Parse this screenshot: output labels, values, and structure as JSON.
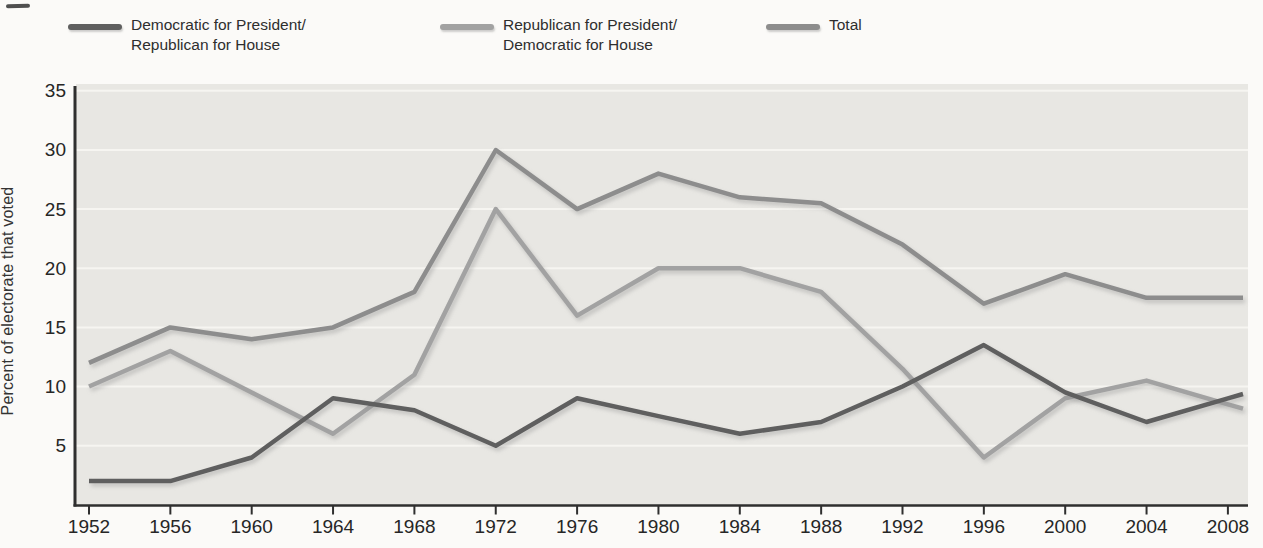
{
  "figure": {
    "y_axis_title": "Percent of electorate that voted",
    "y_tick_labels": [
      "35",
      "30",
      "25",
      "20",
      "15",
      "10",
      "5"
    ],
    "x_tick_labels": [
      "1952",
      "1956",
      "1960",
      "1964",
      "1968",
      "1972",
      "1976",
      "1980",
      "1984",
      "1988",
      "1992",
      "1996",
      "2000",
      "2004",
      "2008"
    ]
  },
  "legend": {
    "items": [
      {
        "id": "dem-pres-rep-house",
        "lines": [
          "Democratic for President/",
          "Republican for House"
        ],
        "color": "#5f5f5f"
      },
      {
        "id": "rep-pres-dem-house",
        "lines": [
          "Republican for President/",
          "Democratic for House"
        ],
        "color": "#a2a2a2"
      },
      {
        "id": "total",
        "lines": [
          "Total"
        ],
        "color": "#8d8d8d"
      }
    ]
  },
  "colors": {
    "plot_background": "#e8e7e3",
    "gridline": "#f6f5f1",
    "axis": "#2f2f2f",
    "tick_text": "#262626",
    "dem_line": "#5f5f5f",
    "rep_line": "#a2a2a2",
    "total_line": "#8d8d8d"
  },
  "chart_data": {
    "type": "line",
    "title": "",
    "xlabel": "",
    "ylabel": "Percent of electorate that voted",
    "x": [
      1952,
      1956,
      1960,
      1964,
      1968,
      1972,
      1976,
      1980,
      1984,
      1988,
      1992,
      1996,
      2000,
      2004,
      2008
    ],
    "ylim": [
      0,
      35
    ],
    "yticks": [
      35,
      30,
      25,
      20,
      15,
      10,
      5
    ],
    "grid": true,
    "legend_position": "top",
    "series": [
      {
        "name": "Democratic for President/Republican for House",
        "color": "#5f5f5f",
        "values": [
          2,
          2,
          4,
          9,
          8,
          5,
          9,
          7.5,
          6,
          7,
          10,
          13.5,
          9.5,
          7,
          9
        ]
      },
      {
        "name": "Republican for President/Democratic for House",
        "color": "#a2a2a2",
        "values": [
          10,
          13,
          9.5,
          6,
          11,
          25,
          16,
          20,
          20,
          18,
          11.5,
          4,
          9,
          10.5,
          8.5
        ]
      },
      {
        "name": "Total",
        "color": "#8d8d8d",
        "values": [
          12,
          15,
          14,
          15,
          18,
          30,
          25,
          28,
          26,
          25.5,
          22,
          17,
          19.5,
          17.5,
          17.5
        ]
      }
    ]
  }
}
